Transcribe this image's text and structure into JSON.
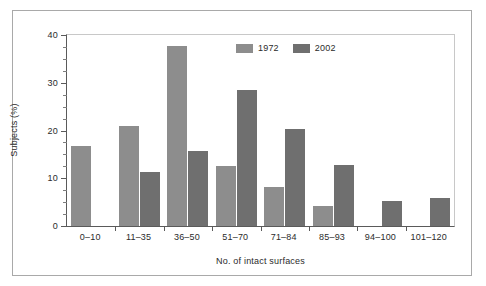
{
  "chart_data": {
    "type": "bar",
    "title": "",
    "subtitle": "",
    "xlabel": "No. of intact surfaces",
    "ylabel": "Subjects (%)",
    "categories": [
      "0–10",
      "11–35",
      "36–50",
      "51–70",
      "71–84",
      "85–93",
      "94–100",
      "101–120"
    ],
    "series": [
      {
        "name": "1972",
        "color": "#8d8d8d",
        "values": [
          16.8,
          20.9,
          37.6,
          12.5,
          8.2,
          4.1,
          null,
          null
        ]
      },
      {
        "name": "2002",
        "color": "#6f6f6f",
        "values": [
          null,
          11.3,
          15.8,
          28.4,
          20.3,
          12.8,
          5.2,
          5.8
        ]
      }
    ],
    "ylim": [
      0,
      40
    ],
    "yticks": [
      0,
      10,
      20,
      30,
      40
    ],
    "ytick_labels": [
      "0",
      "10",
      "20",
      "30",
      "40"
    ],
    "yminor_step": 2.5,
    "grid": false,
    "legend_position": "top-center",
    "legend_entries": [
      "1972",
      "2002"
    ]
  },
  "axis": {
    "ytick_labels": [
      "40",
      "30",
      "20",
      "10",
      "0"
    ],
    "ytick_values": [
      40,
      30,
      20,
      10,
      0
    ]
  },
  "legend": {
    "entries": [
      {
        "label": "1972",
        "color": "#8d8d8d"
      },
      {
        "label": "2002",
        "color": "#6f6f6f"
      }
    ]
  },
  "colors": {
    "series_1972": "#8d8d8d",
    "series_2002": "#6f6f6f",
    "axis_line": "#5a5a5a",
    "frame_border": "#a9a9a9",
    "plot_border_light": "#c8c8c8",
    "text": "#2b2b2b",
    "background": "#ffffff"
  }
}
